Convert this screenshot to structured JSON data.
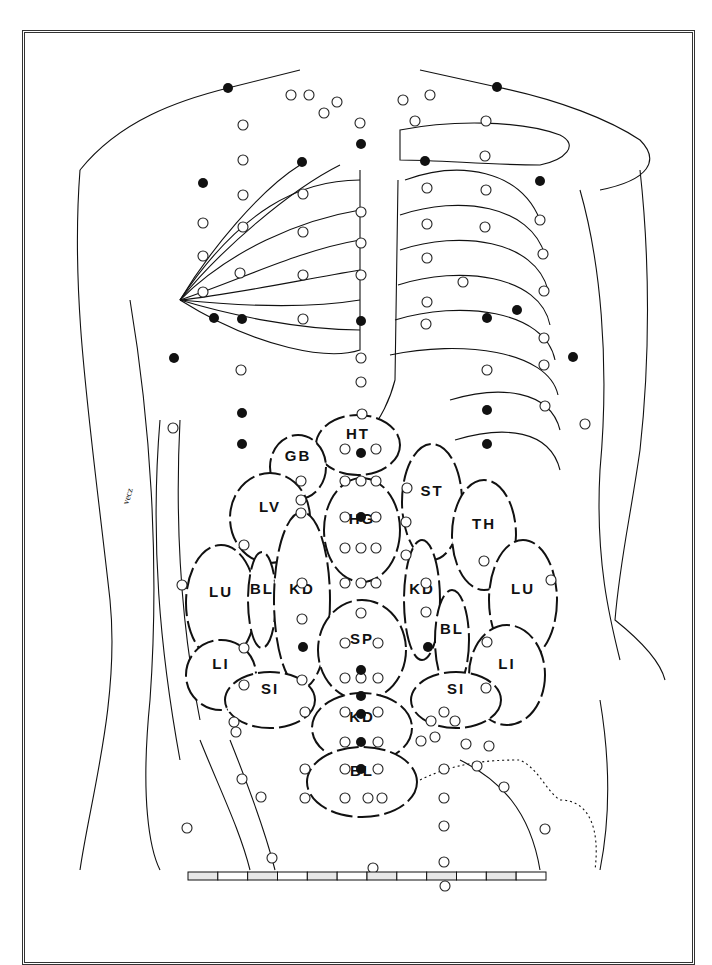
{
  "diagram": {
    "type": "anatomical-acupuncture-chart",
    "view": "anterior torso",
    "organ_zones": [
      {
        "id": "HT",
        "label": "HT",
        "cx": 358,
        "cy": 445,
        "rx": 42,
        "ry": 30
      },
      {
        "id": "GB",
        "label": "GB",
        "cx": 298,
        "cy": 467,
        "rx": 28,
        "ry": 32
      },
      {
        "id": "LV",
        "label": "LV",
        "cx": 270,
        "cy": 518,
        "rx": 40,
        "ry": 45
      },
      {
        "id": "ST",
        "label": "ST",
        "cx": 432,
        "cy": 502,
        "rx": 30,
        "ry": 58
      },
      {
        "id": "HG",
        "label": "HG",
        "cx": 362,
        "cy": 530,
        "rx": 38,
        "ry": 52
      },
      {
        "id": "TH",
        "label": "TH",
        "cx": 484,
        "cy": 535,
        "rx": 32,
        "ry": 55
      },
      {
        "id": "LU-right",
        "label": "LU",
        "cx": 221,
        "cy": 603,
        "rx": 35,
        "ry": 58
      },
      {
        "id": "BL-right",
        "label": "BL",
        "cx": 262,
        "cy": 600,
        "rx": 14,
        "ry": 48
      },
      {
        "id": "KD-right",
        "label": "KD",
        "cx": 302,
        "cy": 600,
        "rx": 28,
        "ry": 88
      },
      {
        "id": "KD-left",
        "label": "KD",
        "cx": 422,
        "cy": 600,
        "rx": 18,
        "ry": 60
      },
      {
        "id": "BL-left",
        "label": "BL",
        "cx": 452,
        "cy": 640,
        "rx": 17,
        "ry": 50
      },
      {
        "id": "LU-left",
        "label": "LU",
        "cx": 523,
        "cy": 600,
        "rx": 34,
        "ry": 60
      },
      {
        "id": "SP",
        "label": "SP",
        "cx": 362,
        "cy": 650,
        "rx": 44,
        "ry": 50
      },
      {
        "id": "LI-right",
        "label": "LI",
        "cx": 221,
        "cy": 675,
        "rx": 35,
        "ry": 35
      },
      {
        "id": "LI-left",
        "label": "LI",
        "cx": 507,
        "cy": 675,
        "rx": 38,
        "ry": 50
      },
      {
        "id": "SI-right",
        "label": "SI",
        "cx": 270,
        "cy": 700,
        "rx": 45,
        "ry": 28
      },
      {
        "id": "SI-left",
        "label": "SI",
        "cx": 456,
        "cy": 700,
        "rx": 45,
        "ry": 28
      },
      {
        "id": "KD-center",
        "label": "KD",
        "cx": 362,
        "cy": 728,
        "rx": 50,
        "ry": 35
      },
      {
        "id": "BL-center",
        "label": "BL",
        "cx": 362,
        "cy": 782,
        "rx": 55,
        "ry": 35
      }
    ],
    "points_filled": [
      [
        228,
        88
      ],
      [
        497,
        87
      ],
      [
        203,
        183
      ],
      [
        302,
        162
      ],
      [
        361,
        144
      ],
      [
        425,
        161
      ],
      [
        540,
        181
      ],
      [
        214,
        318
      ],
      [
        242,
        319
      ],
      [
        361,
        321
      ],
      [
        487,
        318
      ],
      [
        517,
        310
      ],
      [
        573,
        357
      ],
      [
        174,
        358
      ],
      [
        242,
        413
      ],
      [
        242,
        444
      ],
      [
        487,
        410
      ],
      [
        487,
        444
      ],
      [
        361,
        453
      ],
      [
        361,
        517
      ],
      [
        303,
        647
      ],
      [
        428,
        647
      ],
      [
        361,
        670
      ],
      [
        361,
        696
      ],
      [
        361,
        714
      ],
      [
        361,
        742
      ],
      [
        361,
        769
      ]
    ],
    "points_open": [
      [
        291,
        95
      ],
      [
        309,
        95
      ],
      [
        324,
        113
      ],
      [
        337,
        102
      ],
      [
        360,
        123
      ],
      [
        361,
        212
      ],
      [
        361,
        243
      ],
      [
        361,
        275
      ],
      [
        361,
        358
      ],
      [
        361,
        382
      ],
      [
        362,
        414
      ],
      [
        243,
        125
      ],
      [
        243,
        160
      ],
      [
        243,
        195
      ],
      [
        243,
        227
      ],
      [
        203,
        223
      ],
      [
        203,
        256
      ],
      [
        203,
        292
      ],
      [
        240,
        273
      ],
      [
        303,
        194
      ],
      [
        303,
        232
      ],
      [
        303,
        275
      ],
      [
        303,
        319
      ],
      [
        403,
        100
      ],
      [
        430,
        95
      ],
      [
        415,
        121
      ],
      [
        486,
        121
      ],
      [
        485,
        156
      ],
      [
        486,
        190
      ],
      [
        485,
        227
      ],
      [
        427,
        188
      ],
      [
        427,
        224
      ],
      [
        427,
        258
      ],
      [
        427,
        302
      ],
      [
        426,
        324
      ],
      [
        540,
        220
      ],
      [
        543,
        254
      ],
      [
        544,
        291
      ],
      [
        544,
        338
      ],
      [
        544,
        365
      ],
      [
        463,
        282
      ],
      [
        487,
        370
      ],
      [
        545,
        406
      ],
      [
        585,
        424
      ],
      [
        173,
        428
      ],
      [
        241,
        370
      ],
      [
        345,
        449
      ],
      [
        376,
        449
      ],
      [
        301,
        481
      ],
      [
        301,
        500
      ],
      [
        301,
        513
      ],
      [
        345,
        481
      ],
      [
        361,
        481
      ],
      [
        376,
        481
      ],
      [
        345,
        517
      ],
      [
        376,
        517
      ],
      [
        345,
        548
      ],
      [
        361,
        548
      ],
      [
        376,
        548
      ],
      [
        345,
        583
      ],
      [
        361,
        583
      ],
      [
        376,
        583
      ],
      [
        244,
        545
      ],
      [
        302,
        583
      ],
      [
        302,
        619
      ],
      [
        302,
        680
      ],
      [
        244,
        648
      ],
      [
        244,
        685
      ],
      [
        182,
        585
      ],
      [
        407,
        488
      ],
      [
        406,
        522
      ],
      [
        406,
        555
      ],
      [
        426,
        583
      ],
      [
        426,
        612
      ],
      [
        484,
        561
      ],
      [
        551,
        580
      ],
      [
        487,
        642
      ],
      [
        486,
        688
      ],
      [
        455,
        721
      ],
      [
        466,
        744
      ],
      [
        345,
        643
      ],
      [
        378,
        643
      ],
      [
        361,
        613
      ],
      [
        345,
        678
      ],
      [
        361,
        678
      ],
      [
        378,
        678
      ],
      [
        345,
        712
      ],
      [
        378,
        712
      ],
      [
        345,
        742
      ],
      [
        378,
        742
      ],
      [
        345,
        769
      ],
      [
        378,
        769
      ],
      [
        305,
        712
      ],
      [
        305,
        769
      ],
      [
        305,
        798
      ],
      [
        345,
        798
      ],
      [
        368,
        798
      ],
      [
        382,
        798
      ],
      [
        444,
        712
      ],
      [
        444,
        769
      ],
      [
        444,
        798
      ],
      [
        421,
        741
      ],
      [
        234,
        722
      ],
      [
        236,
        732
      ],
      [
        242,
        779
      ],
      [
        261,
        797
      ],
      [
        187,
        828
      ],
      [
        431,
        721
      ],
      [
        435,
        737
      ],
      [
        489,
        746
      ],
      [
        504,
        787
      ],
      [
        477,
        766
      ],
      [
        444,
        826
      ],
      [
        444,
        862
      ],
      [
        545,
        829
      ],
      [
        272,
        858
      ],
      [
        373,
        868
      ],
      [
        445,
        886
      ]
    ],
    "scale_bar": {
      "segments": 12,
      "x": 188,
      "y": 872,
      "width": 358,
      "height": 8
    },
    "signature": "vecz"
  }
}
